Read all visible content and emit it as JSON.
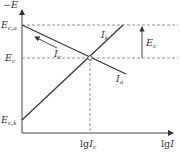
{
  "diagram": {
    "type": "electrode-polarization (Evans-type) diagram",
    "axes": {
      "y_label": {
        "prefix": "−",
        "var": "E"
      },
      "x_label": {
        "func": "lg",
        "var": "I"
      }
    },
    "y_ticks": [
      {
        "id": "eca",
        "main": "E",
        "sub": "c,a"
      },
      {
        "id": "ec",
        "main": "E",
        "sub": "c"
      },
      {
        "id": "eck",
        "main": "E",
        "sub": "c,k"
      }
    ],
    "x_ticks": [
      {
        "id": "lgic",
        "func": "lg",
        "main": "I",
        "sub": "c"
      }
    ],
    "curves": [
      {
        "id": "anodic",
        "main": "I",
        "sub": "a"
      },
      {
        "id": "cathodic",
        "main": "I",
        "sub": "k"
      }
    ],
    "annotations": {
      "current_arrow": {
        "main": "I",
        "sub": "c"
      },
      "potential_span": {
        "main": "E",
        "sub": "c"
      }
    },
    "colors": {
      "line": "#333333",
      "dashed": "#777777"
    }
  }
}
